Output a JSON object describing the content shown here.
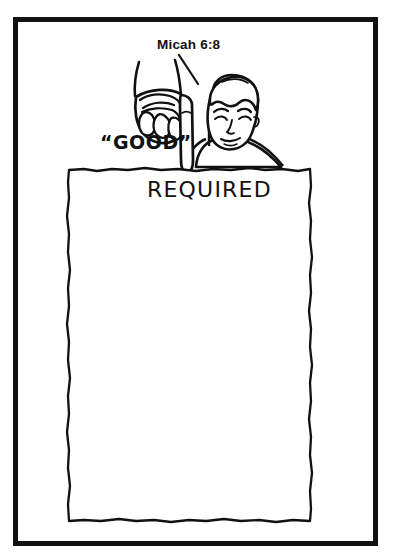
{
  "image": {
    "title": "Micah 6:8 cartoon",
    "background_color": "#ffffff",
    "ink_color": "#111111",
    "width": 393,
    "height": 560
  },
  "frame": {
    "name": "outer-border",
    "stroke_color": "#111111",
    "stroke_width": 5
  },
  "labels": {
    "scripture_reference": "Micah 6:8",
    "quoted_word": "“GOOD”",
    "tablet_word": "REQUIRED"
  },
  "figure": {
    "hand": "pointing-down-hand",
    "head": "mans-head-face",
    "tablet": "blank-parchment-tablet"
  },
  "annotations": {
    "leader_line": "line-from-reference-to-hand"
  }
}
